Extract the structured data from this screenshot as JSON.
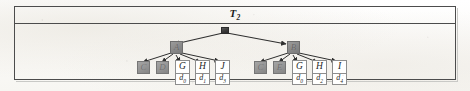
{
  "figure": {
    "title": "T",
    "title_subscript": "2",
    "caption_band_label": "T2"
  },
  "tree": {
    "root": {
      "label": "",
      "style": "dark-box"
    },
    "internal_nodes": [
      {
        "id": "A",
        "label": "A",
        "style": "gray-box"
      },
      {
        "id": "B",
        "label": "B",
        "style": "gray-box"
      }
    ],
    "left_children": [
      {
        "label": "C",
        "style": "gray-box"
      },
      {
        "label": "D",
        "style": "gray-box"
      },
      {
        "label": "G",
        "data": "d",
        "data_subscript": "0",
        "style": "white-cell"
      },
      {
        "label": "H",
        "data": "d",
        "data_subscript": "1",
        "style": "white-cell"
      },
      {
        "label": "J",
        "data": "d",
        "data_subscript": "3",
        "style": "white-cell"
      }
    ],
    "right_children": [
      {
        "label": "C",
        "style": "gray-box"
      },
      {
        "label": "E",
        "style": "gray-box"
      },
      {
        "label": "G",
        "data": "d",
        "data_subscript": "0",
        "style": "white-cell"
      },
      {
        "label": "H",
        "data": "d",
        "data_subscript": "2",
        "style": "white-cell"
      },
      {
        "label": "I",
        "data": "d",
        "data_subscript": "4",
        "style": "white-cell"
      }
    ]
  },
  "colors": {
    "frame_border": "#4c4c4c",
    "node_gray": "#8f8f8f",
    "node_dark": "#3a3a3a",
    "cell_border": "#8d8d8d",
    "edge_stroke": "#2f2f2f",
    "text": "#1f1f1f",
    "paper": "#fdfdfc"
  }
}
